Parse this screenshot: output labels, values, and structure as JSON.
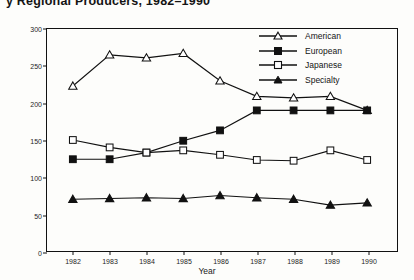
{
  "chart_data": {
    "type": "line",
    "title": "y Regional Producers, 1982–1990",
    "xlabel": "Year",
    "ylabel": "Production Volume",
    "categories": [
      "1982",
      "1983",
      "1984",
      "1985",
      "1986",
      "1987",
      "1988",
      "1989",
      "1990"
    ],
    "x": [
      1982,
      1983,
      1984,
      1985,
      1986,
      1987,
      1988,
      1989,
      1990
    ],
    "ylim": [
      0,
      300
    ],
    "yticks": [
      0,
      50,
      100,
      150,
      200,
      250,
      300
    ],
    "grid": false,
    "legend_position": "top-right",
    "series": [
      {
        "name": "American",
        "marker": "open-triangle",
        "values": [
          223,
          265,
          261,
          267,
          230,
          209,
          207,
          209,
          190
        ]
      },
      {
        "name": "European",
        "marker": "filled-square",
        "values": [
          124,
          124,
          133,
          149,
          163,
          190,
          190,
          190,
          190
        ]
      },
      {
        "name": "Japanese",
        "marker": "open-square",
        "values": [
          150,
          140,
          133,
          136,
          130,
          123,
          122,
          136,
          123
        ]
      },
      {
        "name": "Specialty",
        "marker": "filled-triangle",
        "values": [
          70,
          71,
          72,
          71,
          75,
          72,
          70,
          62,
          65
        ]
      }
    ]
  },
  "legend": {
    "items": [
      {
        "label": "American"
      },
      {
        "label": "European"
      },
      {
        "label": "Japanese"
      },
      {
        "label": "Specialty"
      }
    ]
  }
}
